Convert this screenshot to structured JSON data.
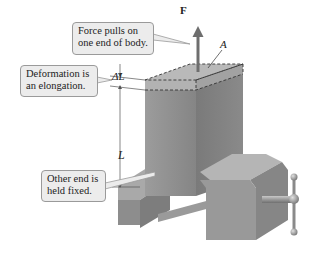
{
  "diagram": {
    "callouts": {
      "force": {
        "lines": [
          "Force pulls on",
          "one end of body."
        ]
      },
      "deformation": {
        "lines": [
          "Deformation is",
          "an elongation."
        ]
      },
      "fixed": {
        "lines": [
          "Other end is",
          "held fixed."
        ]
      }
    },
    "labels": {
      "force": "F",
      "area": "A",
      "elongation": "ΔL",
      "length": "L"
    },
    "colors": {
      "callout_fill": "#ececec",
      "callout_border": "#9a9a9a",
      "block_front": "#8f8f8f",
      "block_side": "#7c7c7c",
      "block_top": "#b8b8b8",
      "arrow": "#6e6e6e"
    }
  }
}
